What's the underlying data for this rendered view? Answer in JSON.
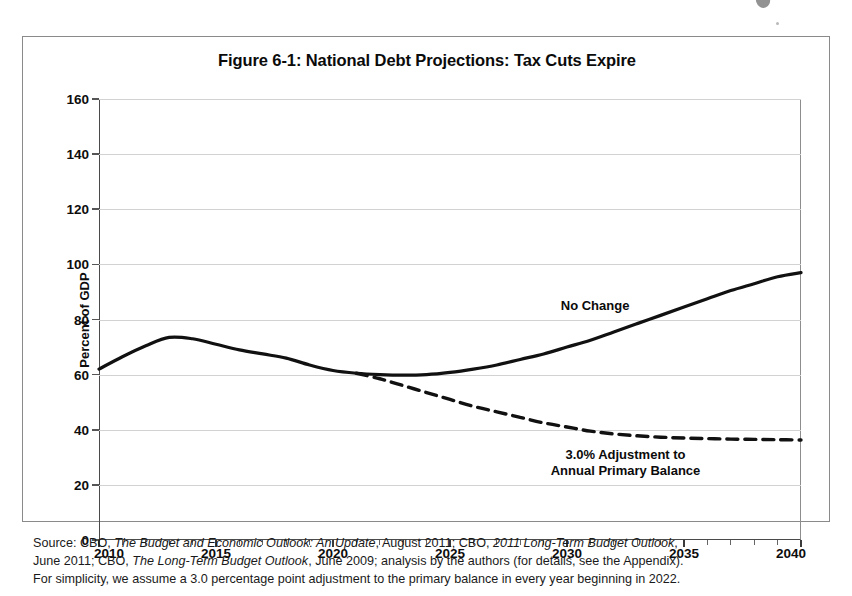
{
  "figure": {
    "title": "Figure 6-1: National Debt Projections: Tax Cuts Expire",
    "source_note_line1_a": "Source: CBO, ",
    "source_note_line1_i1": "The Budget and Economic Outlook: An Update",
    "source_note_line1_b": ", August 2011; CBO, ",
    "source_note_line1_i2": "2011 Long-Term Budget Outlook",
    "source_note_line1_c": ",",
    "source_note_line2_a": "June 2011; CBO, ",
    "source_note_line2_i1": "The Long-Term Budget Outlook",
    "source_note_line2_b": ", June 2009; analysis by the authors (for details, see the Appendix).",
    "source_note_line3": "For simplicity, we assume a 3.0 percentage point adjustment to the primary balance in every year beginning in 2022."
  },
  "chart_data": {
    "type": "line",
    "title": "Figure 6-1: National Debt Projections: Tax Cuts Expire",
    "subtitle": "",
    "xlabel": "",
    "ylabel": "Percent of GDP",
    "xlim": [
      2010,
      2040
    ],
    "ylim": [
      0,
      160
    ],
    "ytick_values": [
      0,
      20,
      40,
      60,
      80,
      100,
      120,
      140,
      160
    ],
    "xtick_values": [
      2010,
      2015,
      2020,
      2025,
      2030,
      2035,
      2040
    ],
    "xtick_labels": [
      "2010",
      "2015",
      "2020",
      "2025",
      "2030",
      "2035",
      "2040"
    ],
    "xtick_minor_step": 1,
    "grid": "horizontal",
    "legend_position": "inline-annotations",
    "annotations": [
      {
        "text": "No Change",
        "x": 2031.2,
        "y": 85,
        "lines": [
          "No Change"
        ]
      },
      {
        "text": "3.0% Adjustment to Annual Primary Balance",
        "x": 2032.5,
        "y": 28,
        "lines": [
          "3.0% Adjustment to",
          "Annual Primary Balance"
        ]
      }
    ],
    "x": [
      2010,
      2011,
      2012,
      2013,
      2014,
      2015,
      2016,
      2017,
      2018,
      2019,
      2020,
      2021,
      2022,
      2023,
      2024,
      2025,
      2026,
      2027,
      2028,
      2029,
      2030,
      2031,
      2032,
      2033,
      2034,
      2035,
      2036,
      2037,
      2038,
      2039,
      2040
    ],
    "series": [
      {
        "name": "No Change",
        "style": "solid",
        "color": "#111111",
        "width": 3.2,
        "values": [
          62,
          66.5,
          70.5,
          73.5,
          73,
          71,
          69,
          67.5,
          66,
          63.5,
          61.5,
          60.5,
          60,
          59.8,
          60,
          60.8,
          62,
          63.5,
          65.5,
          67.5,
          70,
          72.5,
          75.5,
          78.5,
          81.5,
          84.5,
          87.5,
          90.5,
          93,
          95.5,
          97
        ]
      },
      {
        "name": "3.0% Adjustment to Annual Primary Balance",
        "style": "dashed",
        "color": "#111111",
        "width": 3.4,
        "values": [
          null,
          null,
          null,
          null,
          null,
          null,
          null,
          null,
          null,
          null,
          null,
          60.5,
          58.5,
          56,
          53.5,
          51,
          48.5,
          46.5,
          44.5,
          42.5,
          41,
          39.5,
          38.5,
          37.8,
          37.3,
          37,
          36.8,
          36.6,
          36.5,
          36.4,
          36.3
        ]
      }
    ]
  }
}
